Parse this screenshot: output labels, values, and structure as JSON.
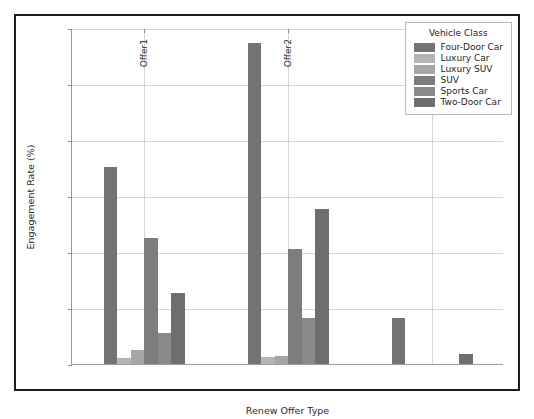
{
  "chart_data": {
    "type": "bar",
    "title": "",
    "xlabel": "Renew Offer Type",
    "ylabel": "Engagement Rate (%)",
    "categories": [
      "Offer1",
      "Offer2",
      "Offer3"
    ],
    "ylim": [
      0,
      12
    ],
    "yticks": [
      0,
      2,
      4,
      6,
      8,
      10,
      12
    ],
    "ytick_labels": [
      "0",
      "2",
      "4",
      "6",
      "8",
      "10",
      "12"
    ],
    "grid": true,
    "legend_position": "upper right",
    "legend_title": "Vehicle Class",
    "series": [
      {
        "name": "Four-Door Car",
        "color": "#737373",
        "values": [
          7.05,
          11.45,
          1.65
        ]
      },
      {
        "name": "Luxury Car",
        "color": "#b4b4b4",
        "values": [
          0.2,
          0.25,
          0
        ]
      },
      {
        "name": "Luxury SUV",
        "color": "#a6a6a6",
        "values": [
          0.5,
          0.3,
          0
        ]
      },
      {
        "name": "SUV",
        "color": "#7d7d7d",
        "values": [
          4.5,
          4.1,
          0
        ]
      },
      {
        "name": "Sports Car",
        "color": "#8a8a8a",
        "values": [
          1.1,
          1.65,
          0
        ]
      },
      {
        "name": "Two-Door Car",
        "color": "#6e6e6e",
        "values": [
          2.55,
          5.55,
          0.35
        ]
      }
    ]
  }
}
